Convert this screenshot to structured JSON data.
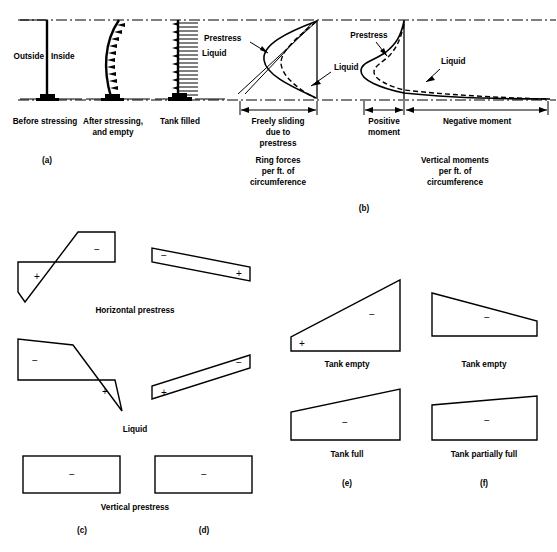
{
  "figure": {
    "accent_color": "#000000",
    "background_color": "#ffffff"
  },
  "panel_a": {
    "id": "(a)",
    "wall_states": [
      {
        "key": "before",
        "label": "Before stressing",
        "inner_labels": [
          "Outside",
          "Inside"
        ]
      },
      {
        "key": "after",
        "label": "After stressing, and empty"
      },
      {
        "key": "filled",
        "label": "Tank filled",
        "inner_labels": [
          "Liquid"
        ]
      }
    ],
    "label_outside": "Outside",
    "label_inside": "Inside",
    "label_liquid": "Liquid",
    "caption_before": "Before stressing",
    "caption_after_line1": "After stressing,",
    "caption_after_line2": "and empty",
    "caption_tank_filled": "Tank filled"
  },
  "panel_b": {
    "id": "(b)",
    "ring_forces": {
      "curve_labels": [
        "Prestress",
        "Liquid"
      ],
      "label_prestress": "Prestress",
      "label_liquid": "Liquid",
      "dimension_label_line1": "Freely sliding",
      "dimension_label_line2": "due to",
      "dimension_label_line3": "prestress",
      "caption_line1": "Ring forces",
      "caption_line2": "per ft. of",
      "caption_line3": "circumference"
    },
    "vertical_moments": {
      "label_prestress": "Prestress",
      "label_liquid": "Liquid",
      "dimension_label_positive_line1": "Positive",
      "dimension_label_positive_line2": "moment",
      "dimension_label_negative": "Negative moment",
      "caption_line1": "Vertical moments",
      "caption_line2": "per ft. of",
      "caption_line3": "circumference"
    }
  },
  "panel_c": {
    "id": "(c)",
    "rows": [
      {
        "name": "horizontal-prestress",
        "label": "Horizontal prestress",
        "signs": [
          "+",
          "−"
        ]
      },
      {
        "name": "liquid",
        "label": "Liquid",
        "signs": [
          "−",
          "+"
        ]
      },
      {
        "name": "vertical-prestress",
        "label": "Vertical prestress",
        "signs": [
          "−"
        ]
      }
    ],
    "label_horizontal_prestress": "Horizontal prestress",
    "label_liquid": "Liquid",
    "label_vertical_prestress": "Vertical prestress",
    "sign_hp_left": "+",
    "sign_hp_right": "−",
    "sign_liq_left": "−",
    "sign_liq_right": "+",
    "sign_vp": "−"
  },
  "panel_d": {
    "id": "(d)",
    "sign_hp_left": "−",
    "sign_hp_right": "+",
    "sign_liq_left": "+",
    "sign_liq_right": "−",
    "sign_vp": "−"
  },
  "panel_e": {
    "id": "(e)",
    "diagrams": [
      {
        "name": "tank-empty",
        "label": "Tank empty",
        "signs": [
          "+",
          "−"
        ]
      },
      {
        "name": "tank-full",
        "label": "Tank full",
        "signs": [
          "−"
        ]
      }
    ],
    "label_tank_empty": "Tank empty",
    "label_tank_full": "Tank full",
    "sign_empty_plus": "+",
    "sign_empty_minus": "−",
    "sign_full_minus": "−"
  },
  "panel_f": {
    "id": "(f)",
    "diagrams": [
      {
        "name": "tank-empty",
        "label": "Tank empty",
        "signs": [
          "−"
        ]
      },
      {
        "name": "tank-partially-full",
        "label": "Tank partially full",
        "signs": [
          "−"
        ]
      }
    ],
    "label_tank_empty": "Tank empty",
    "label_tank_partially_full": "Tank partially full",
    "sign_empty_minus": "−",
    "sign_partial_minus": "−"
  }
}
